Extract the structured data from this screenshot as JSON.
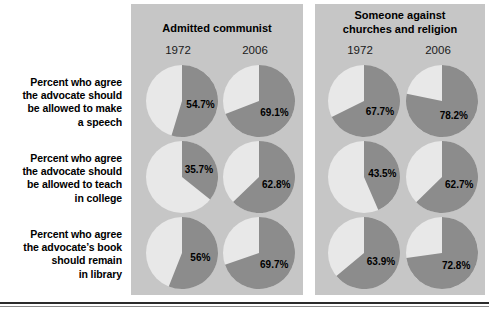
{
  "colors": {
    "panel_background": "#c6c6c6",
    "page_background": "#ffffff",
    "slice_agree": "#8c8c8c",
    "slice_remainder": "#e8e8e8",
    "label_text": "#000000",
    "rule": "#2b2b2b"
  },
  "row_labels": [
    "Percent who agree the advocate should be allowed to make a speech",
    "Percent who agree the advocate should be allowed to teach in college",
    "Percent who agree the advocate’s book should remain in library"
  ],
  "row_label_lines": [
    [
      "Percent who agree",
      "the advocate should",
      "be allowed to make",
      "a speech"
    ],
    [
      "Percent who agree",
      "the advocate should",
      "be allowed to teach",
      "in college"
    ],
    [
      "Percent who agree",
      "the advocate’s book",
      "should remain",
      "in library"
    ]
  ],
  "panels": [
    {
      "title": "Admitted communist",
      "title_lines": [
        "Admitted communist"
      ],
      "columns": [
        "1972",
        "2006"
      ]
    },
    {
      "title": "Someone against churches and religion",
      "title_lines": [
        "Someone against",
        "churches and religion"
      ],
      "columns": [
        "1972",
        "2006"
      ]
    }
  ],
  "chart_data": {
    "type": "pie",
    "title": "",
    "grid": false,
    "legend": "none",
    "units": "percent",
    "row_categories": [
      "Percent who agree the advocate should be allowed to make a speech",
      "Percent who agree the advocate should be allowed to teach in college",
      "Percent who agree the advocate’s book should remain in library"
    ],
    "column_groups": [
      "Admitted communist",
      "Someone against churches and religion"
    ],
    "years": [
      "1972",
      "2006"
    ],
    "series": [
      {
        "name": "Admitted communist 1972",
        "values": [
          54.7,
          35.7,
          56.0
        ]
      },
      {
        "name": "Admitted communist 2006",
        "values": [
          69.1,
          62.8,
          69.7
        ]
      },
      {
        "name": "Someone against churches and religion 1972",
        "values": [
          67.7,
          43.5,
          63.9
        ]
      },
      {
        "name": "Someone against churches and religion 2006",
        "values": [
          78.2,
          62.7,
          72.8
        ]
      }
    ],
    "pies": [
      {
        "panel": 0,
        "row": 0,
        "year": "1972",
        "value": 54.7,
        "label": "54.7%"
      },
      {
        "panel": 0,
        "row": 0,
        "year": "2006",
        "value": 69.1,
        "label": "69.1%"
      },
      {
        "panel": 0,
        "row": 1,
        "year": "1972",
        "value": 35.7,
        "label": "35.7%"
      },
      {
        "panel": 0,
        "row": 1,
        "year": "2006",
        "value": 62.8,
        "label": "62.8%"
      },
      {
        "panel": 0,
        "row": 2,
        "year": "1972",
        "value": 56.0,
        "label": "56%"
      },
      {
        "panel": 0,
        "row": 2,
        "year": "2006",
        "value": 69.7,
        "label": "69.7%"
      },
      {
        "panel": 1,
        "row": 0,
        "year": "1972",
        "value": 67.7,
        "label": "67.7%"
      },
      {
        "panel": 1,
        "row": 0,
        "year": "2006",
        "value": 78.2,
        "label": "78.2%"
      },
      {
        "panel": 1,
        "row": 1,
        "year": "1972",
        "value": 43.5,
        "label": "43.5%"
      },
      {
        "panel": 1,
        "row": 1,
        "year": "2006",
        "value": 62.7,
        "label": "62.7%"
      },
      {
        "panel": 1,
        "row": 2,
        "year": "1972",
        "value": 63.9,
        "label": "63.9%"
      },
      {
        "panel": 1,
        "row": 2,
        "year": "2006",
        "value": 72.8,
        "label": "72.8%"
      }
    ]
  }
}
